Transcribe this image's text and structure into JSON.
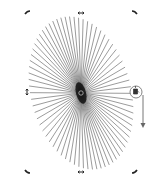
{
  "canvas": {
    "background": "#ffffff",
    "object": {
      "type": "radial-line-burst",
      "center": [
        81,
        93
      ],
      "radius_x": 50,
      "radius_y": 78,
      "rotation_deg": -15,
      "spoke_count": 72,
      "stroke_color": "#333333"
    },
    "handles": {
      "rotate": [
        "top-left",
        "top-right",
        "bottom-left",
        "bottom-right"
      ],
      "scale": [
        "top",
        "bottom",
        "left"
      ]
    },
    "tool_cursor": {
      "icon": "paint-bucket-icon",
      "arrow": "down-arrow-icon"
    }
  }
}
